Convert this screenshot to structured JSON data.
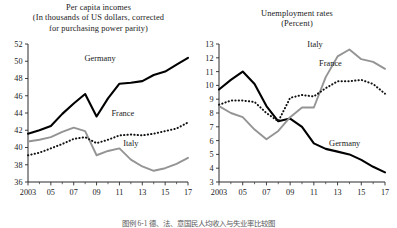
{
  "caption": "图例 6-1  德、法、意国民人均收入与失业率比较图",
  "chart_data": [
    {
      "type": "line",
      "panel": "left",
      "title": "Per capita incomes",
      "subtitle": "(In thousands of US dollars, corrected for purchasing power parity)",
      "title_lines": [
        "Per capita incomes",
        "(In thousands of US dollars, corrected",
        "for purchasing power parity)"
      ],
      "xlabel": "",
      "ylabel": "",
      "grid": false,
      "legend_position": "inline-labels",
      "xlim": [
        2003,
        2017
      ],
      "ylim": [
        36,
        52
      ],
      "yticks": [
        36,
        38,
        40,
        42,
        44,
        46,
        48,
        50,
        52
      ],
      "ytick_labels": [
        "36",
        "38",
        "40",
        "42",
        "44",
        "46",
        "48",
        "50",
        "52"
      ],
      "x": [
        2003,
        2004,
        2005,
        2006,
        2007,
        2008,
        2009,
        2010,
        2011,
        2012,
        2013,
        2014,
        2015,
        2016,
        2017
      ],
      "xticks": [
        2003,
        2005,
        2007,
        2009,
        2011,
        2013,
        2015,
        2017
      ],
      "xtick_labels": [
        "2003",
        "05",
        "07",
        "09",
        "11",
        "13",
        "15",
        "17"
      ],
      "series": [
        {
          "name": "Germany",
          "style": "solid-black",
          "color": "#000000",
          "values": [
            41.6,
            42.0,
            42.5,
            43.9,
            45.1,
            46.2,
            43.6,
            45.7,
            47.4,
            47.5,
            47.7,
            48.4,
            48.8,
            49.6,
            50.4
          ]
        },
        {
          "name": "Italy",
          "style": "solid-gray",
          "color": "#949494",
          "values": [
            40.7,
            40.9,
            41.2,
            41.8,
            42.3,
            41.9,
            39.1,
            39.6,
            39.9,
            38.6,
            37.8,
            37.3,
            37.6,
            38.1,
            38.8
          ]
        },
        {
          "name": "France",
          "style": "dotted",
          "color": "#111111",
          "values": [
            39.1,
            39.4,
            39.9,
            40.4,
            41.0,
            41.2,
            40.5,
            40.9,
            41.4,
            41.5,
            41.4,
            41.6,
            41.9,
            42.2,
            42.9
          ]
        }
      ],
      "annotations": [
        {
          "text": "Germany",
          "x": 2009.3,
          "y": 50.0
        },
        {
          "text": "France",
          "x": 2011.3,
          "y": 43.6
        },
        {
          "text": "Italy",
          "x": 2012.0,
          "y": 40.2
        }
      ]
    },
    {
      "type": "line",
      "panel": "right",
      "title": "Unemployment rates",
      "subtitle": "(Percent)",
      "title_lines": [
        "Unemployment rates",
        "(Percent)"
      ],
      "xlabel": "",
      "ylabel": "",
      "grid": false,
      "legend_position": "inline-labels",
      "xlim": [
        2003,
        2017
      ],
      "ylim": [
        3,
        13
      ],
      "yticks": [
        3,
        4,
        5,
        6,
        7,
        8,
        9,
        10,
        11,
        12,
        13
      ],
      "ytick_labels": [
        "3",
        "4",
        "5",
        "6",
        "7",
        "8",
        "9",
        "10",
        "11",
        "12",
        "13"
      ],
      "x": [
        2003,
        2004,
        2005,
        2006,
        2007,
        2008,
        2009,
        2010,
        2011,
        2012,
        2013,
        2014,
        2015,
        2016,
        2017
      ],
      "xticks": [
        2003,
        2005,
        2007,
        2009,
        2011,
        2013,
        2015,
        2017
      ],
      "xtick_labels": [
        "2003",
        "05",
        "07",
        "09",
        "11",
        "13",
        "15",
        "17"
      ],
      "series": [
        {
          "name": "Germany",
          "style": "solid-black",
          "color": "#000000",
          "values": [
            9.7,
            10.4,
            11.0,
            10.1,
            8.5,
            7.4,
            7.6,
            7.0,
            5.8,
            5.4,
            5.2,
            5.0,
            4.6,
            4.1,
            3.7
          ]
        },
        {
          "name": "Italy",
          "style": "solid-gray",
          "color": "#949494",
          "values": [
            8.5,
            8.0,
            7.7,
            6.8,
            6.1,
            6.7,
            7.7,
            8.4,
            8.4,
            10.6,
            12.1,
            12.6,
            11.9,
            11.7,
            11.2
          ]
        },
        {
          "name": "France",
          "style": "dotted",
          "color": "#111111",
          "values": [
            8.6,
            8.9,
            8.9,
            8.8,
            8.0,
            7.4,
            9.1,
            9.3,
            9.2,
            9.8,
            10.3,
            10.3,
            10.4,
            10.1,
            9.4
          ]
        }
      ],
      "annotations": [
        {
          "text": "Italy",
          "x": 2011.1,
          "y": 12.8
        },
        {
          "text": "France",
          "x": 2012.4,
          "y": 11.4
        },
        {
          "text": "Germany",
          "x": 2013.6,
          "y": 5.6
        }
      ]
    }
  ]
}
